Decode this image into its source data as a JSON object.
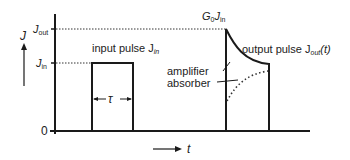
{
  "diagram": {
    "y_axis": {
      "label": "J",
      "ticks": [
        {
          "label": "J",
          "sub": "out"
        },
        {
          "label": "J",
          "sub": "in"
        },
        {
          "label": "0"
        }
      ]
    },
    "x_axis": {
      "label": "t"
    },
    "input_pulse": {
      "label": "input pulse J",
      "sub": "in",
      "width_label": "τ"
    },
    "output_pulse": {
      "label": "output pulse J",
      "sub": "out",
      "suffix": "(t)",
      "peak_label_prefix": "G",
      "peak_label_sub0": "0",
      "peak_label_mid": "J",
      "peak_label_sub1": "in"
    },
    "annotations": {
      "amplifier": "amplifier",
      "absorber": "absorber"
    },
    "colors": {
      "line": "#1a1a1a",
      "dotted": "#333333"
    }
  }
}
